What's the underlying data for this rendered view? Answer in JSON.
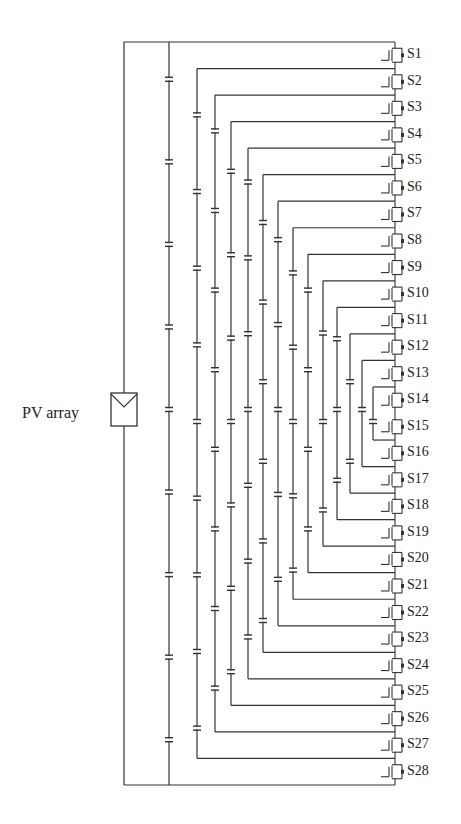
{
  "diagram": {
    "pv_label": "PV array",
    "switch_labels": [
      "S1",
      "S2",
      "S3",
      "S4",
      "S5",
      "S6",
      "S7",
      "S8",
      "S9",
      "S10",
      "S11",
      "S12",
      "S13",
      "S14",
      "S15",
      "S16",
      "S17",
      "S18",
      "S19",
      "S20",
      "S21",
      "S22",
      "S23",
      "S24",
      "S25",
      "S26",
      "S27",
      "S28"
    ],
    "switch_count": 28,
    "capacitor_column_x": [
      169,
      197,
      215,
      231,
      248,
      263,
      278,
      293,
      308,
      323,
      337,
      350,
      362,
      373
    ],
    "wire_color": "#333333",
    "background": "#ffffff",
    "caption": ""
  }
}
